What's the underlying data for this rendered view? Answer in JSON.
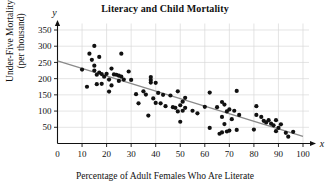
{
  "chart_data": {
    "type": "scatter",
    "title": "Literacy and Child Mortality",
    "xlabel": "Percentage of Adult Females Who Are Literate",
    "ylabel_line1": "Under-Five Mortality",
    "ylabel_line2": "(per thousand)",
    "x_axis_variable": "x",
    "y_axis_variable": "y",
    "xlim": [
      0,
      103
    ],
    "ylim": [
      0,
      375
    ],
    "xticks": [
      0,
      10,
      20,
      30,
      40,
      50,
      60,
      70,
      80,
      90,
      100
    ],
    "yticks": [
      50,
      100,
      150,
      200,
      250,
      300,
      350
    ],
    "grid": true,
    "grid_color": "#d9d9d9",
    "point_color": "#111111",
    "point_radius": 2.1,
    "trendline": {
      "label": "least-squares regression line",
      "color": "#8a8a8a",
      "x_start": 0,
      "y_start": 255,
      "x_end": 100,
      "y_end": 22
    },
    "points": [
      [
        10,
        228
      ],
      [
        12,
        175
      ],
      [
        13,
        277
      ],
      [
        14,
        258
      ],
      [
        15,
        301
      ],
      [
        15,
        240
      ],
      [
        15,
        225
      ],
      [
        16,
        212
      ],
      [
        16,
        183
      ],
      [
        17,
        267
      ],
      [
        17,
        219
      ],
      [
        18,
        214
      ],
      [
        18,
        184
      ],
      [
        19,
        206
      ],
      [
        20,
        215
      ],
      [
        21,
        197
      ],
      [
        21,
        160
      ],
      [
        22,
        231
      ],
      [
        22,
        179
      ],
      [
        23,
        213
      ],
      [
        24,
        212
      ],
      [
        25,
        209
      ],
      [
        25,
        193
      ],
      [
        26,
        277
      ],
      [
        26,
        206
      ],
      [
        27,
        197
      ],
      [
        29,
        222
      ],
      [
        30,
        196
      ],
      [
        32,
        152
      ],
      [
        33,
        124
      ],
      [
        35,
        161
      ],
      [
        36,
        151
      ],
      [
        37,
        86
      ],
      [
        38,
        205
      ],
      [
        38,
        196
      ],
      [
        38,
        188
      ],
      [
        39,
        139
      ],
      [
        40,
        187
      ],
      [
        40,
        125
      ],
      [
        41,
        156
      ],
      [
        42,
        124
      ],
      [
        43,
        150
      ],
      [
        44,
        115
      ],
      [
        46,
        148
      ],
      [
        47,
        112
      ],
      [
        48,
        110
      ],
      [
        49,
        161
      ],
      [
        49,
        99
      ],
      [
        50,
        118
      ],
      [
        50,
        67
      ],
      [
        51,
        129
      ],
      [
        51,
        101
      ],
      [
        52,
        141
      ],
      [
        52,
        110
      ],
      [
        55,
        101
      ],
      [
        57,
        93
      ],
      [
        60,
        113
      ],
      [
        62,
        157
      ],
      [
        62,
        48
      ],
      [
        65,
        112
      ],
      [
        66,
        30
      ],
      [
        67,
        128
      ],
      [
        67,
        82
      ],
      [
        67,
        34
      ],
      [
        68,
        120
      ],
      [
        68,
        60
      ],
      [
        69,
        99
      ],
      [
        69,
        37
      ],
      [
        70,
        105
      ],
      [
        70,
        40
      ],
      [
        71,
        75
      ],
      [
        72,
        101
      ],
      [
        73,
        162
      ],
      [
        73,
        42
      ],
      [
        74,
        88
      ],
      [
        80,
        43
      ],
      [
        81,
        115
      ],
      [
        81,
        88
      ],
      [
        83,
        82
      ],
      [
        84,
        70
      ],
      [
        85,
        65
      ],
      [
        86,
        72
      ],
      [
        87,
        61
      ],
      [
        88,
        56
      ],
      [
        89,
        72
      ],
      [
        89,
        38
      ],
      [
        90,
        48
      ],
      [
        91,
        59
      ],
      [
        93,
        33
      ],
      [
        94,
        21
      ],
      [
        96,
        36
      ]
    ]
  }
}
